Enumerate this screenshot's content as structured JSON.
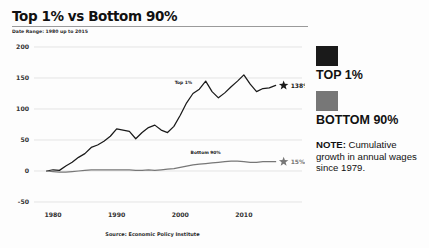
{
  "header": {
    "title": "Top 1% vs Bottom 90%",
    "subtitle": "Date Range: 1980 up to 2015"
  },
  "source": {
    "text": "Source: Economic Policy Institute"
  },
  "legend": {
    "entries": [
      {
        "label": "TOP 1%",
        "color": "#1a1a1a",
        "swatch_name": "legend-swatch-top-1"
      },
      {
        "label": "BOTTOM 90%",
        "color": "#777777",
        "swatch_name": "legend-swatch-bottom-90"
      }
    ],
    "note_heading": "NOTE:",
    "note_body": " Cumulative growth in annual wages since 1979."
  },
  "chart_data": {
    "type": "line",
    "title": "Top 1% vs Bottom 90%",
    "subtitle": "Date Range: 1980 up to 2015",
    "xlabel": "",
    "ylabel": "",
    "xlim": [
      1977,
      2016
    ],
    "ylim": [
      -50,
      200
    ],
    "yticks": [
      -50,
      0,
      50,
      100,
      150,
      200
    ],
    "ytick_labels": [
      "-50",
      "0",
      "50",
      "100",
      "150",
      "200"
    ],
    "xticks": [
      1980,
      1990,
      2000,
      2010
    ],
    "xtick_labels": [
      "1980",
      "1990",
      "2000",
      "2010"
    ],
    "grid": "horizontal",
    "legend_position": "right",
    "annotations": [
      {
        "text": "Top 1%",
        "x": 2000.5,
        "y": 140,
        "name": "inline-label-top-1"
      },
      {
        "text": "Bottom 90%",
        "x": 2004.0,
        "y": 28,
        "name": "inline-label-bottom-90"
      },
      {
        "text": "138%",
        "x": 2015,
        "y": 138,
        "name": "endpoint-label-top-1"
      },
      {
        "text": "15%",
        "x": 2015,
        "y": 15,
        "name": "endpoint-label-bottom-90"
      }
    ],
    "x": [
      1979,
      1980,
      1981,
      1982,
      1983,
      1984,
      1985,
      1986,
      1987,
      1988,
      1989,
      1990,
      1991,
      1992,
      1993,
      1994,
      1995,
      1996,
      1997,
      1998,
      1999,
      2000,
      2001,
      2002,
      2003,
      2004,
      2005,
      2006,
      2007,
      2008,
      2009,
      2010,
      2011,
      2012,
      2013,
      2014,
      2015
    ],
    "series": [
      {
        "name": "TOP 1%",
        "color": "#1a1a1a",
        "endpoint_marker": "star",
        "endpoint_value": 138,
        "values": [
          0,
          2,
          1,
          8,
          14,
          22,
          28,
          38,
          42,
          48,
          56,
          68,
          66,
          64,
          52,
          62,
          70,
          74,
          66,
          62,
          72,
          90,
          110,
          125,
          132,
          145,
          128,
          118,
          126,
          136,
          145,
          155,
          140,
          128,
          133,
          134,
          138
        ]
      },
      {
        "name": "BOTTOM 90%",
        "color": "#777777",
        "endpoint_marker": "star",
        "endpoint_value": 15,
        "values": [
          0,
          -1,
          -2,
          -2,
          -1,
          0,
          1,
          2,
          2,
          2,
          2,
          2,
          2,
          2,
          1,
          1,
          2,
          1,
          2,
          3,
          4,
          6,
          8,
          10,
          11,
          12,
          13,
          14,
          15,
          16,
          16,
          15,
          14,
          14,
          15,
          15,
          15
        ]
      }
    ]
  }
}
